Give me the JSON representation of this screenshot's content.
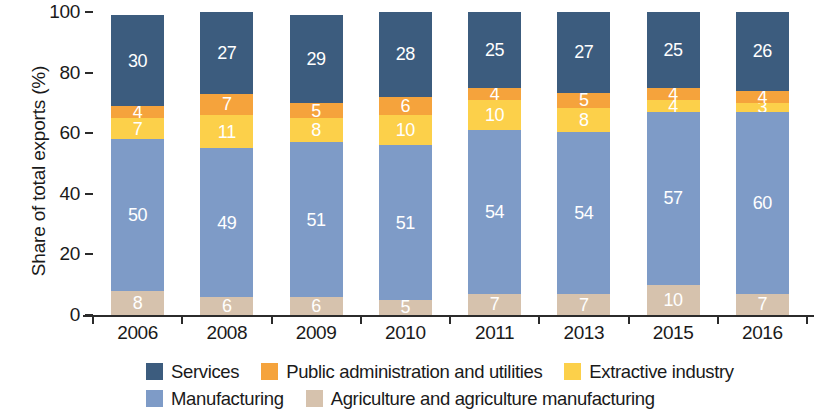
{
  "chart_data": {
    "type": "bar",
    "subtype": "stacked-vertical-100percent",
    "title": "",
    "xlabel": "",
    "ylabel": "Share of total exports (%)",
    "ylim": [
      0,
      100
    ],
    "yticks": [
      0,
      20,
      40,
      60,
      80,
      100
    ],
    "grid": false,
    "legend_position": "bottom",
    "categories": [
      "2006",
      "2008",
      "2009",
      "2010",
      "2011",
      "2013",
      "2015",
      "2016"
    ],
    "stack_order_bottom_to_top": [
      "Agriculture and agriculture manufacturing",
      "Manufacturing",
      "Extractive industry",
      "Public administration and utilities",
      "Services"
    ],
    "series": [
      {
        "name": "Services",
        "color": "#3b5b7d",
        "label_color": "#ffffff",
        "values": [
          30,
          27,
          29,
          28,
          25,
          27,
          25,
          26
        ]
      },
      {
        "name": "Public administration and utilities",
        "color": "#f5a councils"
      }
    ]
  }
}
